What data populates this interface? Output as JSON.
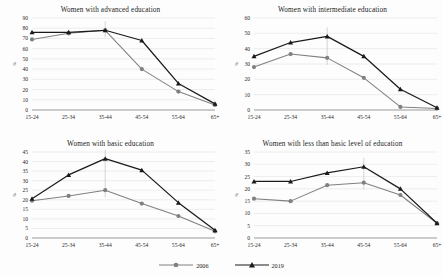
{
  "figure": {
    "legend": {
      "position": "bottom-center",
      "entries": [
        {
          "label": "2006",
          "color": "#808080",
          "marker": "circle"
        },
        {
          "label": "2019",
          "color": "#1a1a1a",
          "marker": "triangle"
        }
      ]
    },
    "axis_label_y": "%"
  },
  "chart_data": [
    {
      "type": "line",
      "panel": "top-left",
      "title": "Women with advanced education",
      "xlabel": "",
      "ylabel": "%",
      "categories": [
        "15-24",
        "25-34",
        "35-44",
        "45-54",
        "55-64",
        "65+"
      ],
      "ylim": [
        0,
        90
      ],
      "yticks": [
        0,
        10,
        20,
        30,
        40,
        50,
        60,
        70,
        80,
        90
      ],
      "grid": true,
      "series": [
        {
          "name": "2006",
          "color": "#808080",
          "marker": "circle",
          "values": [
            69,
            75,
            78,
            40,
            18,
            5
          ]
        },
        {
          "name": "2019",
          "color": "#1a1a1a",
          "marker": "triangle",
          "values": [
            76,
            76,
            78,
            68,
            26,
            6
          ]
        }
      ]
    },
    {
      "type": "line",
      "panel": "top-right",
      "title": "Women with intermediate education",
      "xlabel": "",
      "ylabel": "%",
      "categories": [
        "15-24",
        "25-34",
        "35-44",
        "45-54",
        "55-64",
        "65+"
      ],
      "ylim": [
        0,
        60
      ],
      "yticks": [
        0,
        10,
        20,
        30,
        40,
        50,
        60
      ],
      "grid": true,
      "series": [
        {
          "name": "2006",
          "color": "#808080",
          "marker": "circle",
          "values": [
            28,
            36.5,
            34,
            21,
            2,
            1
          ]
        },
        {
          "name": "2019",
          "color": "#1a1a1a",
          "marker": "triangle",
          "values": [
            35,
            44,
            48,
            35,
            13.5,
            1.5
          ]
        }
      ]
    },
    {
      "type": "line",
      "panel": "bottom-left",
      "title": "Women with basic education",
      "xlabel": "",
      "ylabel": "%",
      "categories": [
        "15-24",
        "25-34",
        "35-44",
        "45-54",
        "55-64",
        "65+"
      ],
      "ylim": [
        0,
        45
      ],
      "yticks": [
        0,
        5,
        10,
        15,
        20,
        25,
        30,
        35,
        40,
        45
      ],
      "grid": true,
      "series": [
        {
          "name": "2006",
          "color": "#808080",
          "marker": "circle",
          "values": [
            19.5,
            22,
            25,
            18,
            11.5,
            3.5
          ]
        },
        {
          "name": "2019",
          "color": "#1a1a1a",
          "marker": "triangle",
          "values": [
            20.5,
            33,
            41.5,
            35.5,
            18.5,
            4
          ]
        }
      ]
    },
    {
      "type": "line",
      "panel": "bottom-right",
      "title": "Women with less than basic level of education",
      "xlabel": "",
      "ylabel": "%",
      "categories": [
        "15-24",
        "25-34",
        "35-44",
        "45-54",
        "55-64",
        "65+"
      ],
      "ylim": [
        0,
        35
      ],
      "yticks": [
        0,
        5,
        10,
        15,
        20,
        25,
        30,
        35
      ],
      "grid": true,
      "series": [
        {
          "name": "2006",
          "color": "#808080",
          "marker": "circle",
          "values": [
            16,
            15,
            21.5,
            22.5,
            17.5,
            6
          ]
        },
        {
          "name": "2019",
          "color": "#1a1a1a",
          "marker": "triangle",
          "values": [
            23,
            23,
            26.5,
            29,
            20,
            6
          ]
        }
      ]
    }
  ]
}
